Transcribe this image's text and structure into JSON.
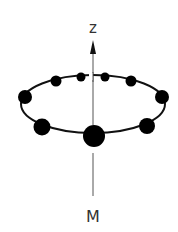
{
  "diagram": {
    "axis_label_top": "z",
    "axis_label_bottom": "M",
    "colors": {
      "ring": "#111111",
      "dots": "#000000",
      "axis": "#555555",
      "label": "#333333",
      "background": "#ffffff"
    },
    "ring": {
      "cx": 93,
      "cy": 104,
      "rx": 72,
      "ry": 29
    },
    "dots": [
      {
        "cx": 81,
        "cy": 77,
        "r": 4.5
      },
      {
        "cx": 105,
        "cy": 77,
        "r": 4.5
      },
      {
        "cx": 56,
        "cy": 81,
        "r": 5.5
      },
      {
        "cx": 131,
        "cy": 81,
        "r": 5.5
      },
      {
        "cx": 25,
        "cy": 97,
        "r": 7
      },
      {
        "cx": 162,
        "cy": 97,
        "r": 7
      },
      {
        "cx": 42,
        "cy": 127,
        "r": 8.5
      },
      {
        "cx": 147,
        "cy": 126,
        "r": 8
      },
      {
        "cx": 94,
        "cy": 136,
        "r": 11
      }
    ]
  }
}
